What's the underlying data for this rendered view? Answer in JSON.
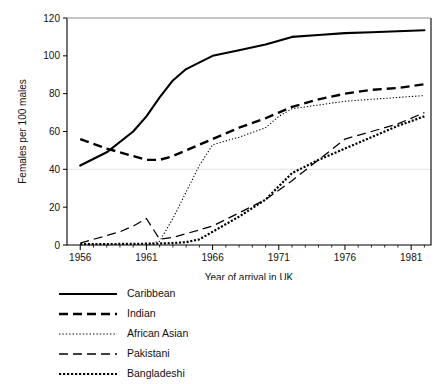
{
  "chart_data": {
    "type": "line",
    "title": "",
    "xlabel": "Year of arrival in UK",
    "ylabel": "Females per 100 males",
    "xlim": [
      1955,
      1982.5
    ],
    "ylim": [
      0,
      120
    ],
    "xticks": [
      1956,
      1961,
      1966,
      1971,
      1976,
      1981
    ],
    "xtick_labels": [
      "1956",
      "1961",
      "1966",
      "1971",
      "1976",
      "1981"
    ],
    "yticks": [
      0,
      20,
      40,
      60,
      80,
      100,
      120
    ],
    "ytick_labels": [
      "0",
      "20",
      "40",
      "60",
      "80",
      "100",
      "120"
    ],
    "grid": false,
    "legend_position": "below-left",
    "series": [
      {
        "name": "Caribbean",
        "style": "solid",
        "x": [
          1956,
          1958,
          1960,
          1961,
          1962,
          1963,
          1964,
          1966,
          1968,
          1970,
          1971,
          1972,
          1974,
          1976,
          1978,
          1980,
          1982
        ],
        "y": [
          42,
          49,
          60,
          68,
          78,
          87,
          93,
          100,
          103,
          106,
          108,
          110,
          111,
          112,
          112.5,
          113,
          113.5
        ]
      },
      {
        "name": "Indian",
        "style": "dashed-bold",
        "x": [
          1956,
          1958,
          1960,
          1961,
          1962,
          1963,
          1964,
          1966,
          1968,
          1970,
          1971,
          1972,
          1974,
          1976,
          1978,
          1980,
          1982
        ],
        "y": [
          56,
          51,
          47,
          45,
          45,
          47,
          50,
          56,
          62,
          67,
          70,
          73,
          77,
          80,
          82,
          83,
          85
        ]
      },
      {
        "name": "African Asian",
        "style": "dotted-fine",
        "x": [
          1961,
          1962,
          1963,
          1964,
          1965,
          1966,
          1967,
          1968,
          1970,
          1971,
          1972,
          1974,
          1976,
          1978,
          1980,
          1982
        ],
        "y": [
          0,
          2,
          14,
          28,
          42,
          53,
          55,
          57,
          62,
          68,
          72,
          74,
          76,
          77,
          78,
          79
        ]
      },
      {
        "name": "Pakistani",
        "style": "dashed-thin",
        "x": [
          1956,
          1957,
          1958,
          1959,
          1960,
          1961,
          1962,
          1963,
          1964,
          1966,
          1968,
          1970,
          1971,
          1972,
          1974,
          1976,
          1978,
          1980,
          1982
        ],
        "y": [
          1,
          3,
          5,
          7,
          10,
          14,
          3,
          4,
          6,
          10,
          17,
          24,
          29,
          34,
          45,
          56,
          60,
          64,
          70
        ]
      },
      {
        "name": "Bangladeshi",
        "style": "dotted-bold",
        "x": [
          1956,
          1958,
          1960,
          1961,
          1962,
          1963,
          1964,
          1965,
          1966,
          1968,
          1970,
          1971,
          1972,
          1974,
          1976,
          1978,
          1980,
          1982
        ],
        "y": [
          0.5,
          0.5,
          0.6,
          0.7,
          0.8,
          1,
          1.5,
          3,
          7,
          15,
          24,
          31,
          38,
          45,
          51,
          57,
          63,
          68
        ]
      }
    ]
  },
  "legend": {
    "items": [
      {
        "label": "Caribbean",
        "key": "solid"
      },
      {
        "label": "Indian",
        "key": "dashed-bold"
      },
      {
        "label": "African Asian",
        "key": "dotted-fine"
      },
      {
        "label": "Pakistani",
        "key": "dashed-thin"
      },
      {
        "label": "Bangladeshi",
        "key": "dotted-bold"
      }
    ]
  }
}
